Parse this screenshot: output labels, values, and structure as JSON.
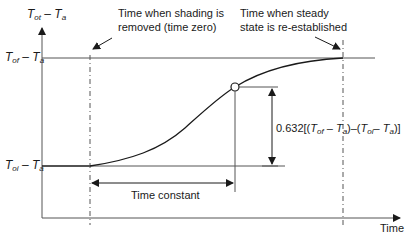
{
  "axes": {
    "y_label_main": "T",
    "y_label_sub1": "ot",
    "y_label_minus": " – ",
    "y_label_sub2": "a",
    "x_label": "Time"
  },
  "levels": {
    "final": {
      "T": "T",
      "sub1": "of",
      "minus": " – ",
      "T2": "T",
      "sub2": "a"
    },
    "initial": {
      "T": "T",
      "sub1": "oi",
      "minus": " – ",
      "T2": "T",
      "sub2": "a"
    }
  },
  "annotations": {
    "time_zero_line1": "Time when shading is",
    "time_zero_line2": "removed (time zero)",
    "steady_line1": "Time when steady",
    "steady_line2": "state is re-established",
    "time_constant": "Time constant",
    "fraction": "0.632[(T",
    "fraction_full": "0.632[(Tof – Ta)–(Toi – Ta)]"
  },
  "colors": {
    "line": "#1a1a1a",
    "grid": "#555555",
    "background": "#ffffff"
  }
}
